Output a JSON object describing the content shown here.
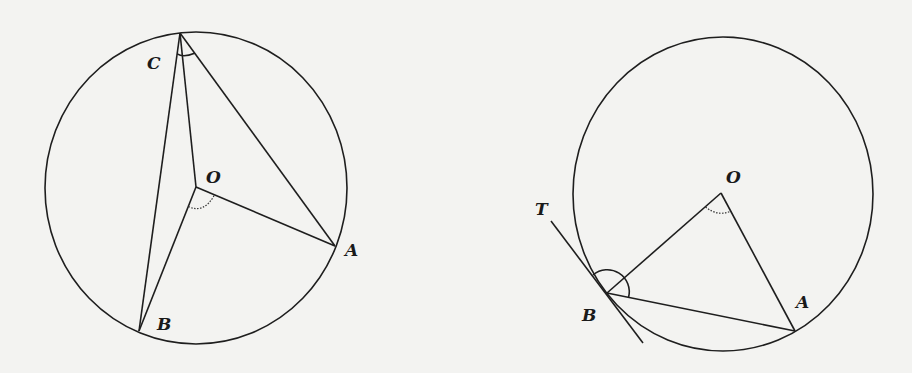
{
  "figure_left": {
    "description": "Inscribed angle ACB and central angle AOB subtending arc AB",
    "labels": {
      "C": "C",
      "O": "O",
      "A": "A",
      "B": "B"
    },
    "circle": {
      "cx": 196,
      "cy": 188,
      "rx": 151,
      "ry": 156
    },
    "points": {
      "C": [
        180,
        33
      ],
      "O": [
        196,
        187
      ],
      "A": [
        335,
        246
      ],
      "B": [
        139,
        331
      ]
    },
    "segments": [
      [
        "C",
        "B"
      ],
      [
        "C",
        "O"
      ],
      [
        "C",
        "A"
      ],
      [
        "O",
        "A"
      ],
      [
        "O",
        "B"
      ]
    ],
    "angle_marks": [
      {
        "vertex": "C",
        "style": "solid",
        "between": [
          "B",
          "A"
        ]
      },
      {
        "vertex": "O",
        "style": "dotted",
        "between": [
          "B",
          "A"
        ]
      }
    ]
  },
  "figure_right": {
    "description": "Tangent-chord angle TBA and central angle BOA",
    "labels": {
      "T": "T",
      "O": "O",
      "A": "A",
      "B": "B"
    },
    "circle": {
      "cx": 723,
      "cy": 194,
      "rx": 150,
      "ry": 157
    },
    "points": {
      "O": [
        721,
        193
      ],
      "B": [
        607,
        293
      ],
      "A": [
        795,
        331
      ],
      "tangent_start": [
        551,
        221
      ],
      "tangent_end": [
        643,
        343
      ]
    },
    "segments": [
      [
        "O",
        "B"
      ],
      [
        "O",
        "A"
      ],
      [
        "B",
        "A"
      ],
      [
        "tangent_start",
        "tangent_end"
      ]
    ],
    "angle_marks": [
      {
        "vertex": "O",
        "style": "dotted",
        "between": [
          "B",
          "A"
        ]
      },
      {
        "vertex": "B",
        "style": "solid",
        "between": [
          "T",
          "A"
        ]
      }
    ]
  },
  "colors": {
    "background": "#f3f3f1",
    "line": "#1e1e1e"
  }
}
